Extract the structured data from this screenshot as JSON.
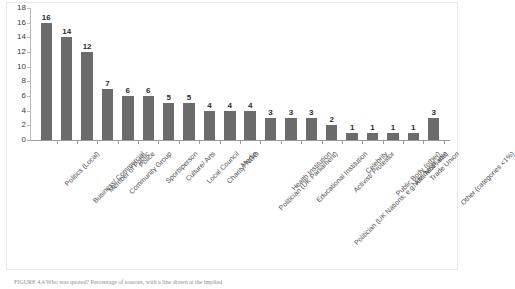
{
  "chart_data": {
    "type": "bar",
    "title": "",
    "xlabel": "",
    "ylabel": "",
    "ylim": [
      0,
      18
    ],
    "yticks": [
      0,
      2,
      4,
      6,
      8,
      10,
      12,
      14,
      16,
      18
    ],
    "grid": false,
    "legend": null,
    "bar_color": "#6b6b6b",
    "categories": [
      "Politics (Local)",
      "Business/ Commercial",
      "Member of Public",
      "Community Group",
      "Police",
      "Sportsperson",
      "Culture/ Arts",
      "Local Council",
      "Charity/ NGO",
      "Media",
      "Politician (UK Parliament)",
      "Health Institution",
      "Educational Institution",
      "Politician (UK Nations, e.g. AM, MSP, etc)",
      "Activist/ Protestor",
      "Celebrity",
      "Public Body (other)",
      "Not Identifiable",
      "Trade Union",
      "Other (categories <1%)"
    ],
    "values": [
      16,
      14,
      12,
      7,
      6,
      6,
      5,
      5,
      4,
      4,
      4,
      3,
      3,
      3,
      2,
      1,
      1,
      1,
      1,
      3
    ],
    "data_labels": [
      "16",
      "14",
      "12",
      "7",
      "6",
      "6",
      "5",
      "5",
      "4",
      "4",
      "4",
      "3",
      "3",
      "3",
      "2",
      "1",
      "1",
      "1",
      "1",
      "3"
    ]
  },
  "caption": {
    "label": "FIGURE 4.4",
    "text": "FIGURE 4.4  Who was quoted? Percentage of sources, with a line drawn at the implied"
  }
}
